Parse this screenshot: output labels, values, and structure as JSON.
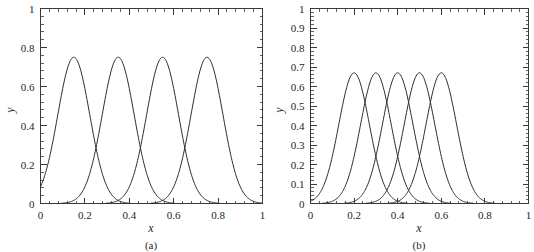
{
  "figure": {
    "panels": [
      "a",
      "b"
    ]
  },
  "panel_a": {
    "subcaption": "(a)",
    "xlabel": "x",
    "ylabel": "y"
  },
  "panel_b": {
    "subcaption": "(b)",
    "xlabel": "x",
    "ylabel": "y"
  },
  "chart_data": [
    {
      "type": "line",
      "title": "",
      "subcaption": "(a)",
      "xlabel": "x",
      "ylabel": "y",
      "xlim": [
        0,
        1
      ],
      "ylim": [
        0,
        1
      ],
      "xticks": [
        0,
        0.2,
        0.4,
        0.6,
        0.8,
        1
      ],
      "xticklabels": [
        "0",
        "0.2",
        "0.4",
        "0.6",
        "0.8",
        "1"
      ],
      "yticks": [
        0,
        0.2,
        0.4,
        0.6,
        0.8,
        1
      ],
      "yticklabels": [
        "0",
        "0.2",
        "0.4",
        "0.6",
        "0.8",
        "1"
      ],
      "x_minor_interval": 0.04,
      "y_minor_interval": 0.04,
      "grid": false,
      "legend": "none",
      "peak_value": 0.75,
      "series": [
        {
          "name": "basis-1",
          "center": 0.15,
          "width": 0.072,
          "peak": 0.75
        },
        {
          "name": "basis-2",
          "center": 0.35,
          "width": 0.072,
          "peak": 0.75
        },
        {
          "name": "basis-3",
          "center": 0.55,
          "width": 0.072,
          "peak": 0.75
        },
        {
          "name": "basis-4",
          "center": 0.75,
          "width": 0.072,
          "peak": 0.75
        }
      ],
      "crossings_y": 0.11,
      "crossings_x": [
        0.25,
        0.45,
        0.65
      ]
    },
    {
      "type": "line",
      "title": "",
      "subcaption": "(b)",
      "xlabel": "x",
      "ylabel": "y",
      "xlim": [
        0,
        1
      ],
      "ylim": [
        0,
        1
      ],
      "xticks": [
        0,
        0.2,
        0.4,
        0.6,
        0.8,
        1
      ],
      "xticklabels": [
        "0",
        "0.2",
        "0.4",
        "0.6",
        "0.8",
        "1"
      ],
      "yticks": [
        0,
        0.1,
        0.2,
        0.3,
        0.4,
        0.5,
        0.6,
        0.7,
        0.8,
        0.9,
        1
      ],
      "yticklabels": [
        "0",
        "0.1",
        "0.2",
        "0.3",
        "0.4",
        "0.5",
        "0.6",
        "0.7",
        "0.8",
        "0.9",
        "1"
      ],
      "x_minor_interval": 0.04,
      "y_minor_interval": 0.02,
      "grid": false,
      "legend": "none",
      "peak_value": 0.67,
      "series": [
        {
          "name": "basis-1",
          "center": 0.2,
          "width": 0.07,
          "peak": 0.67
        },
        {
          "name": "basis-2",
          "center": 0.3,
          "width": 0.07,
          "peak": 0.67
        },
        {
          "name": "basis-3",
          "center": 0.4,
          "width": 0.07,
          "peak": 0.67
        },
        {
          "name": "basis-4",
          "center": 0.5,
          "width": 0.07,
          "peak": 0.67
        },
        {
          "name": "basis-5",
          "center": 0.6,
          "width": 0.07,
          "peak": 0.67
        }
      ],
      "crossings_y": 0.49,
      "crossings_x": [
        0.25,
        0.35,
        0.45,
        0.55
      ]
    }
  ],
  "colors": {
    "curve": "#2e2e2e",
    "axis": "#3a3a3a",
    "text": "#262626",
    "background": "#ffffff"
  }
}
